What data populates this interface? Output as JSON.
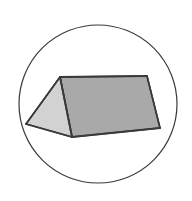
{
  "figure": {
    "canvas": {
      "width": 192,
      "height": 201,
      "background": "#ffffff"
    },
    "circle": {
      "name": "outline-circle",
      "cx": 98,
      "cy": 104,
      "r": 79,
      "stroke": "#3a3a3a",
      "stroke_width": 1.2,
      "fill": "none"
    },
    "solid": {
      "name": "triangular-prism",
      "stroke": "#3a3a3a",
      "stroke_width": 1.6,
      "vertices": {
        "left_apex": [
          26,
          124
        ],
        "ridge_near": [
          60,
          77
        ],
        "ridge_far": [
          147,
          76
        ],
        "base_front": [
          72,
          137
        ],
        "base_right": [
          160,
          128
        ]
      },
      "faces": [
        {
          "name": "left-end-triangle-face",
          "fill": "#d2d2d2",
          "points": "26,124 60,77 72,137"
        },
        {
          "name": "near-slope-face",
          "fill": "#d8d8d8",
          "points": "26,124 60,77 147,76 160,128 72,137"
        },
        {
          "name": "right-slope-face",
          "fill": "#a9a9a9",
          "points": "60,77 147,76 160,128 72,137"
        }
      ],
      "edges": [
        {
          "name": "ridge-edge",
          "points": "60,77 147,76"
        },
        {
          "name": "left-upper-edge",
          "points": "26,124 60,77"
        },
        {
          "name": "left-lower-edge",
          "points": "26,124 72,137"
        },
        {
          "name": "front-base-edge",
          "points": "72,137 160,128"
        },
        {
          "name": "near-ridge-to-base-edge",
          "points": "60,77 72,137"
        },
        {
          "name": "right-end-edge",
          "points": "147,76 160,128"
        }
      ]
    },
    "colors": {
      "light_face": "#d2d2d2",
      "mid_face": "#d8d8d8",
      "dark_face": "#a9a9a9",
      "outline": "#3a3a3a",
      "background": "#ffffff"
    }
  }
}
